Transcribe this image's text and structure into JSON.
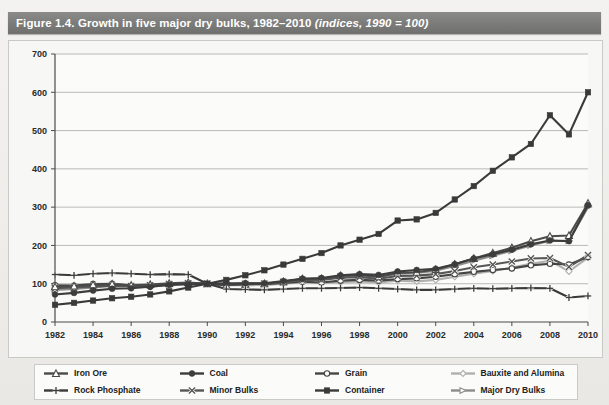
{
  "title": {
    "main": "Figure 1.4. Growth in five major dry bulks, 1982–2010 ",
    "italic": "(indices, 1990 = 100)"
  },
  "chart_data": {
    "type": "line",
    "title": "Figure 1.4. Growth in five major dry bulks, 1982–2010 (indices, 1990 = 100)",
    "xlabel": "",
    "ylabel": "",
    "ylim": [
      0,
      700
    ],
    "yticks": [
      0,
      100,
      200,
      300,
      400,
      500,
      600,
      700
    ],
    "ytick_labels": [
      "0",
      "100",
      "200",
      "300",
      "400",
      "500",
      "600",
      "700"
    ],
    "xlim": [
      1982,
      2010
    ],
    "x": [
      1982,
      1983,
      1984,
      1985,
      1986,
      1987,
      1988,
      1989,
      1990,
      1991,
      1992,
      1993,
      1994,
      1995,
      1996,
      1997,
      1998,
      1999,
      2000,
      2001,
      2002,
      2003,
      2004,
      2005,
      2006,
      2007,
      2008,
      2009,
      2010
    ],
    "xticks": [
      1982,
      1984,
      1986,
      1988,
      1990,
      1992,
      1994,
      1996,
      1998,
      2000,
      2002,
      2004,
      2006,
      2008,
      2010
    ],
    "xtick_labels": [
      "1982",
      "1984",
      "1986",
      "1988",
      "1990",
      "1992",
      "1994",
      "1996",
      "1998",
      "2000",
      "2002",
      "2004",
      "2006",
      "2008",
      "2010"
    ],
    "grid": true,
    "grid_axis": "y",
    "legend_position": "below",
    "series": [
      {
        "name": "Iron Ore",
        "marker": "open-triangle",
        "color": "#4a4a4a",
        "values": [
          92,
          94,
          97,
          99,
          96,
          98,
          101,
          103,
          100,
          96,
          99,
          100,
          105,
          113,
          113,
          121,
          123,
          118,
          128,
          130,
          137,
          151,
          166,
          180,
          194,
          211,
          224,
          226,
          310
        ]
      },
      {
        "name": "Rock Phosphate",
        "marker": "plus",
        "color": "#3a3a3a",
        "values": [
          124,
          122,
          126,
          128,
          126,
          124,
          125,
          124,
          100,
          86,
          85,
          84,
          86,
          88,
          88,
          89,
          90,
          88,
          86,
          84,
          84,
          86,
          88,
          87,
          88,
          89,
          88,
          64,
          68
        ]
      },
      {
        "name": "Coal",
        "marker": "filled-circle",
        "color": "#3d3d3d",
        "values": [
          72,
          76,
          82,
          87,
          88,
          92,
          97,
          99,
          100,
          101,
          101,
          101,
          107,
          113,
          115,
          122,
          125,
          123,
          132,
          136,
          139,
          151,
          166,
          177,
          189,
          203,
          213,
          211,
          305
        ]
      },
      {
        "name": "Minor Bulks",
        "marker": "x",
        "color": "#565656",
        "values": [
          88,
          90,
          93,
          95,
          94,
          96,
          99,
          101,
          100,
          97,
          99,
          100,
          104,
          110,
          110,
          116,
          117,
          113,
          120,
          121,
          125,
          133,
          143,
          150,
          158,
          166,
          167,
          144,
          175
        ]
      },
      {
        "name": "Grain",
        "marker": "open-circle",
        "color": "#454545",
        "values": [
          96,
          95,
          99,
          100,
          95,
          93,
          99,
          100,
          100,
          98,
          101,
          99,
          102,
          105,
          103,
          108,
          110,
          108,
          112,
          114,
          118,
          125,
          131,
          136,
          140,
          148,
          152,
          150,
          170
        ]
      },
      {
        "name": "Container",
        "marker": "filled-square",
        "color": "#3a3a3a",
        "values": [
          45,
          50,
          56,
          62,
          66,
          72,
          80,
          90,
          100,
          110,
          122,
          135,
          150,
          165,
          180,
          200,
          215,
          230,
          265,
          268,
          285,
          320,
          355,
          395,
          430,
          465,
          540,
          490,
          600
        ]
      },
      {
        "name": "Bauxite and Alumina",
        "marker": "open-diamond",
        "color": "#b0b0ae",
        "values": [
          94,
          92,
          95,
          97,
          93,
          92,
          97,
          99,
          100,
          96,
          97,
          96,
          100,
          104,
          102,
          104,
          106,
          103,
          108,
          106,
          110,
          118,
          126,
          133,
          142,
          152,
          160,
          132,
          168
        ]
      },
      {
        "name": "Major Dry Bulks",
        "marker": "open-marker",
        "color": "#8c8c8a",
        "values": [
          84,
          86,
          90,
          94,
          93,
          96,
          99,
          101,
          100,
          98,
          100,
          100,
          105,
          112,
          112,
          119,
          121,
          117,
          126,
          128,
          134,
          146,
          160,
          173,
          186,
          200,
          212,
          212,
          300
        ]
      }
    ]
  },
  "legend": {
    "items": [
      {
        "label": "Iron Ore",
        "marker": "open-triangle",
        "color": "#4a4a4a"
      },
      {
        "label": "Coal",
        "marker": "filled-circle",
        "color": "#3d3d3d"
      },
      {
        "label": "Grain",
        "marker": "open-circle",
        "color": "#454545"
      },
      {
        "label": "Bauxite and Alumina",
        "marker": "open-diamond",
        "color": "#b0b0ae"
      },
      {
        "label": "Rock Phosphate",
        "marker": "plus",
        "color": "#3a3a3a"
      },
      {
        "label": "Minor Bulks",
        "marker": "x",
        "color": "#565656"
      },
      {
        "label": "Container",
        "marker": "filled-square",
        "color": "#3a3a3a"
      },
      {
        "label": "Major Dry Bulks",
        "marker": "open-marker",
        "color": "#8c8c8a"
      }
    ]
  },
  "colors": {
    "title_band": "#7c7c7a",
    "page_bg": "#efeeec",
    "plot_bg": "#f7f7f5",
    "grid": "#a9a9a6",
    "axis": "#4a4a4a"
  }
}
